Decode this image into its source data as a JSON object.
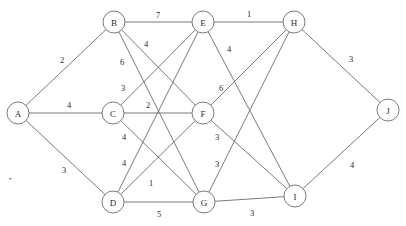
{
  "figure": {
    "background_color": "#ffffff",
    "line_color": "#6b6b6b",
    "text_color": "#2b2b2b",
    "width": 406,
    "height": 226
  },
  "chart_data": {
    "type": "diagram",
    "subtype": "node-link-graph",
    "title": "",
    "directed": false,
    "weighted": true,
    "node_radius": 11,
    "nodes": [
      {
        "id": "A",
        "label": "A",
        "x": 18,
        "y": 113
      },
      {
        "id": "B",
        "label": "B",
        "x": 114,
        "y": 22
      },
      {
        "id": "C",
        "label": "C",
        "x": 113,
        "y": 113
      },
      {
        "id": "D",
        "label": "D",
        "x": 113,
        "y": 202
      },
      {
        "id": "E",
        "label": "E",
        "x": 203,
        "y": 22
      },
      {
        "id": "F",
        "label": "F",
        "x": 203,
        "y": 113
      },
      {
        "id": "G",
        "label": "G",
        "x": 204,
        "y": 202
      },
      {
        "id": "H",
        "label": "H",
        "x": 294,
        "y": 22
      },
      {
        "id": "I",
        "label": "I",
        "x": 295,
        "y": 196
      },
      {
        "id": "J",
        "label": "J",
        "x": 388,
        "y": 110
      }
    ],
    "edges": [
      {
        "source": "A",
        "target": "B",
        "weight": 2,
        "label": "2",
        "lx": 62,
        "ly": 60
      },
      {
        "source": "A",
        "target": "C",
        "weight": 4,
        "label": "4",
        "lx": 69,
        "ly": 105
      },
      {
        "source": "A",
        "target": "D",
        "weight": 3,
        "label": "3",
        "lx": 64,
        "ly": 170
      },
      {
        "source": "B",
        "target": "E",
        "weight": 7,
        "label": "7",
        "lx": 158,
        "ly": 15
      },
      {
        "source": "B",
        "target": "F",
        "weight": 4,
        "label": "4",
        "lx": 146,
        "ly": 44
      },
      {
        "source": "B",
        "target": "G",
        "weight": 6,
        "label": "6",
        "lx": 122,
        "ly": 62
      },
      {
        "source": "C",
        "target": "E",
        "weight": 3,
        "label": "3",
        "lx": 123,
        "ly": 88
      },
      {
        "source": "C",
        "target": "F",
        "weight": 2,
        "label": "2",
        "lx": 148,
        "ly": 105
      },
      {
        "source": "C",
        "target": "G",
        "weight": 4,
        "label": "4",
        "lx": 124,
        "ly": 137
      },
      {
        "source": "D",
        "target": "E",
        "weight": 4,
        "label": "4",
        "lx": 124,
        "ly": 163
      },
      {
        "source": "D",
        "target": "F",
        "weight": 1,
        "label": "1",
        "lx": 151,
        "ly": 183
      },
      {
        "source": "D",
        "target": "G",
        "weight": 5,
        "label": "5",
        "lx": 159,
        "ly": 214
      },
      {
        "source": "E",
        "target": "H",
        "weight": 1,
        "label": "1",
        "lx": 249,
        "ly": 14
      },
      {
        "source": "E",
        "target": "I",
        "weight": 4,
        "label": "4",
        "lx": 229,
        "ly": 49
      },
      {
        "source": "F",
        "target": "H",
        "weight": 6,
        "label": "6",
        "lx": 221,
        "ly": 88
      },
      {
        "source": "F",
        "target": "I",
        "weight": 3,
        "label": "3",
        "lx": 217,
        "ly": 137
      },
      {
        "source": "G",
        "target": "H",
        "weight": 3,
        "label": "3",
        "lx": 217,
        "ly": 164
      },
      {
        "source": "G",
        "target": "I",
        "weight": 3,
        "label": "3",
        "lx": 252,
        "ly": 213
      },
      {
        "source": "H",
        "target": "J",
        "weight": 3,
        "label": "3",
        "lx": 351,
        "ly": 59
      },
      {
        "source": "I",
        "target": "J",
        "weight": 4,
        "label": "4",
        "lx": 352,
        "ly": 165
      }
    ],
    "artifact_specks": [
      {
        "x": 9,
        "y": 178
      }
    ]
  }
}
